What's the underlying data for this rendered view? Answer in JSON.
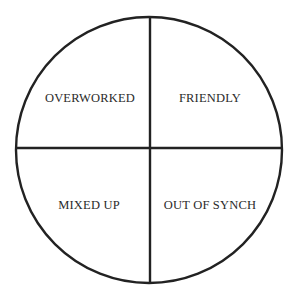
{
  "diagram": {
    "type": "quadrant-circle",
    "quadrants": [
      {
        "position": "top-left",
        "label": "OVERWORKED"
      },
      {
        "position": "top-right",
        "label": "FRIENDLY"
      },
      {
        "position": "bottom-left",
        "label": "MIXED UP"
      },
      {
        "position": "bottom-right",
        "label": "OUT OF SYNCH"
      }
    ],
    "colors": {
      "stroke": "#222222",
      "background": "#ffffff",
      "text": "#2a2a2a"
    }
  }
}
